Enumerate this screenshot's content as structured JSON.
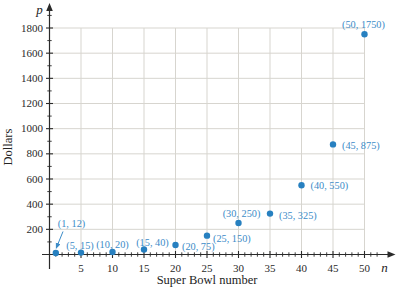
{
  "page": {
    "background": "#ffffff"
  },
  "chart_data": {
    "type": "scatter",
    "title": "",
    "xlabel": "Super Bowl number",
    "ylabel": "Dollars",
    "x_var": "n",
    "y_var": "p",
    "xlim": [
      0,
      54
    ],
    "ylim": [
      0,
      1900
    ],
    "grid": "on",
    "legend": "none",
    "x_ticks": [
      5,
      10,
      15,
      20,
      25,
      30,
      35,
      40,
      45,
      50
    ],
    "x_minor_step": 1,
    "x_minor_max": 52,
    "y_ticks": [
      200,
      400,
      600,
      800,
      1000,
      1200,
      1400,
      1600,
      1800
    ],
    "y_minor_step": 100,
    "y_minor_max": 1900,
    "x": [
      1,
      5,
      10,
      15,
      20,
      25,
      30,
      35,
      40,
      45,
      50
    ],
    "y": [
      12,
      15,
      20,
      40,
      75,
      150,
      250,
      325,
      550,
      875,
      1750
    ],
    "points": [
      {
        "n": 1,
        "p": 12,
        "label": "(1, 12)",
        "anchor": "start",
        "dx": 2,
        "dy": -26,
        "callout": {
          "x1": 63,
          "y1": 231.5,
          "x2": 56.3,
          "y2": 248
        }
      },
      {
        "n": 5,
        "p": 15,
        "label": "(5, 15)",
        "anchor": "middle",
        "dx": -1,
        "dy": -3.5
      },
      {
        "n": 10,
        "p": 20,
        "label": "(10, 20)",
        "anchor": "middle",
        "dx": 0,
        "dy": -4
      },
      {
        "n": 15,
        "p": 40,
        "label": "(15, 40)",
        "anchor": "middle",
        "dx": 8.5,
        "dy": -3.5
      },
      {
        "n": 20,
        "p": 75,
        "label": "(20, 75)",
        "anchor": "start",
        "dx": 6.5,
        "dy": 5
      },
      {
        "n": 25,
        "p": 150,
        "label": "(25, 150)",
        "anchor": "start",
        "dx": 6,
        "dy": 6
      },
      {
        "n": 30,
        "p": 250,
        "label": "(30, 250)",
        "anchor": "middle",
        "dx": 3,
        "dy": -6
      },
      {
        "n": 35,
        "p": 325,
        "label": "(35, 325)",
        "anchor": "start",
        "dx": 9,
        "dy": 5
      },
      {
        "n": 40,
        "p": 550,
        "label": "(40, 550)",
        "anchor": "start",
        "dx": 9,
        "dy": 3.5
      },
      {
        "n": 45,
        "p": 875,
        "label": "(45, 875)",
        "anchor": "start",
        "dx": 9,
        "dy": 5
      },
      {
        "n": 50,
        "p": 1750,
        "label": "(50, 1750)",
        "anchor": "middle",
        "dx": -1,
        "dy": -6
      }
    ],
    "colors": {
      "point": "#2780c0",
      "point_label": "#3c8cc8",
      "axis": "#2a2a2a",
      "grid": "#d7d5cf",
      "background": "#ffffff"
    }
  }
}
